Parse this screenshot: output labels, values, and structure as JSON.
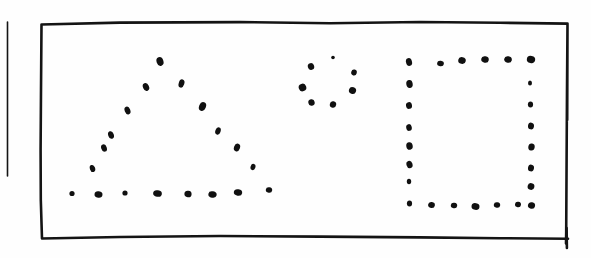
{
  "document": {
    "kind": "hand-drawn-sketch",
    "medium": "ink-on-paper",
    "background_color": "#fefefe",
    "ink_color": "#141414",
    "dot_color": "#101010",
    "width": 591,
    "height": 258,
    "caption": ""
  },
  "frame": {
    "name": "hand-drawn rectangle border",
    "stroke_width": 2.6,
    "path": "M 41.5 24.5 L 120 22.6 L 240 22.1 L 330 23.2 L 420 22.0 L 500 22.8 L 567.5 23.6 L 567.0 90 L 566.6 160 L 566.2 232 L 566.0 243.5 M 567.5 23.6 L 567.2 120 M 41.5 24.5 L 41.0 90 L 40.6 150 L 40.8 200 L 42.0 238.5 L 120 237.0 L 220 236.0 L 320 236.6 L 420 237.4 L 500 238.2 L 568.0 238.8",
    "corner_tick": "M 566.6 228 L 566.9 248"
  },
  "margin_rule": {
    "name": "vertical margin line",
    "x": 7.5,
    "y_top": 22,
    "y_bottom": 176,
    "stroke_width": 1.6
  },
  "shapes": [
    {
      "id": "triangle",
      "label": "dotted triangle",
      "dot_count": 21,
      "dots": [
        {
          "cx": 160.0,
          "cy": 61.5,
          "rx": 3.4,
          "ry": 4.4,
          "rot": -20
        },
        {
          "cx": 146.0,
          "cy": 87.0,
          "rx": 3.0,
          "ry": 4.0,
          "rot": -25
        },
        {
          "cx": 181.5,
          "cy": 83.5,
          "rx": 2.8,
          "ry": 4.2,
          "rot": 18
        },
        {
          "cx": 127.5,
          "cy": 110.5,
          "rx": 2.8,
          "ry": 4.0,
          "rot": -22
        },
        {
          "cx": 202.5,
          "cy": 106.5,
          "rx": 3.4,
          "ry": 4.6,
          "rot": 22
        },
        {
          "cx": 111.0,
          "cy": 135.0,
          "rx": 2.8,
          "ry": 3.9,
          "rot": -20
        },
        {
          "cx": 218.0,
          "cy": 131.0,
          "rx": 2.6,
          "ry": 3.8,
          "rot": 20
        },
        {
          "cx": 104.0,
          "cy": 148.0,
          "rx": 2.8,
          "ry": 3.8,
          "rot": -18
        },
        {
          "cx": 237.0,
          "cy": 147.5,
          "rx": 3.0,
          "ry": 4.0,
          "rot": 20
        },
        {
          "cx": 92.5,
          "cy": 168.5,
          "rx": 2.6,
          "ry": 3.6,
          "rot": -20
        },
        {
          "cx": 253.0,
          "cy": 167.0,
          "rx": 2.4,
          "ry": 3.2,
          "rot": 18
        },
        {
          "cx": 72.0,
          "cy": 193.5,
          "rx": 2.6,
          "ry": 2.6,
          "rot": 0
        },
        {
          "cx": 98.5,
          "cy": 194.5,
          "rx": 4.0,
          "ry": 3.2,
          "rot": 8
        },
        {
          "cx": 125.0,
          "cy": 193.0,
          "rx": 2.6,
          "ry": 2.6,
          "rot": 0
        },
        {
          "cx": 157.5,
          "cy": 193.5,
          "rx": 4.4,
          "ry": 3.2,
          "rot": 10
        },
        {
          "cx": 188.0,
          "cy": 194.0,
          "rx": 3.6,
          "ry": 3.2,
          "rot": 6
        },
        {
          "cx": 212.5,
          "cy": 194.5,
          "rx": 4.2,
          "ry": 3.2,
          "rot": 12
        },
        {
          "cx": 238.0,
          "cy": 192.5,
          "rx": 4.2,
          "ry": 3.2,
          "rot": 10
        },
        {
          "cx": 269.0,
          "cy": 190.0,
          "rx": 3.2,
          "ry": 2.8,
          "rot": 8
        }
      ]
    },
    {
      "id": "circle",
      "label": "dotted circle",
      "dot_count": 8,
      "dots": [
        {
          "cx": 333.0,
          "cy": 57.5,
          "rx": 1.8,
          "ry": 1.8,
          "rot": 0
        },
        {
          "cx": 311.0,
          "cy": 66.5,
          "rx": 3.2,
          "ry": 3.4,
          "rot": -15
        },
        {
          "cx": 354.0,
          "cy": 72.5,
          "rx": 2.8,
          "ry": 3.0,
          "rot": 15
        },
        {
          "cx": 302.5,
          "cy": 87.5,
          "rx": 3.8,
          "ry": 3.8,
          "rot": -20
        },
        {
          "cx": 352.5,
          "cy": 90.5,
          "rx": 3.6,
          "ry": 3.4,
          "rot": 20
        },
        {
          "cx": 311.5,
          "cy": 102.5,
          "rx": 3.2,
          "ry": 3.2,
          "rot": -10
        },
        {
          "cx": 333.0,
          "cy": 104.5,
          "rx": 3.2,
          "ry": 3.2,
          "rot": 10
        }
      ]
    },
    {
      "id": "square",
      "label": "dotted square",
      "dot_count": 22,
      "dots": [
        {
          "cx": 409.0,
          "cy": 62.0,
          "rx": 3.0,
          "ry": 4.0,
          "rot": -15
        },
        {
          "cx": 440.5,
          "cy": 63.5,
          "rx": 3.4,
          "ry": 2.8,
          "rot": 8
        },
        {
          "cx": 462.0,
          "cy": 60.5,
          "rx": 3.8,
          "ry": 3.4,
          "rot": 12
        },
        {
          "cx": 485.0,
          "cy": 59.5,
          "rx": 3.8,
          "ry": 3.2,
          "rot": 10
        },
        {
          "cx": 508.0,
          "cy": 59.5,
          "rx": 3.8,
          "ry": 3.2,
          "rot": 10
        },
        {
          "cx": 531.0,
          "cy": 59.5,
          "rx": 4.2,
          "ry": 3.6,
          "rot": 12
        },
        {
          "cx": 409.5,
          "cy": 84.0,
          "rx": 3.2,
          "ry": 4.0,
          "rot": -10
        },
        {
          "cx": 530.0,
          "cy": 83.0,
          "rx": 2.0,
          "ry": 2.6,
          "rot": 0
        },
        {
          "cx": 409.0,
          "cy": 105.5,
          "rx": 3.0,
          "ry": 3.4,
          "rot": -10
        },
        {
          "cx": 530.5,
          "cy": 104.5,
          "rx": 2.6,
          "ry": 3.0,
          "rot": 0
        },
        {
          "cx": 409.0,
          "cy": 127.5,
          "rx": 2.8,
          "ry": 3.4,
          "rot": -10
        },
        {
          "cx": 531.0,
          "cy": 126.0,
          "rx": 3.0,
          "ry": 3.4,
          "rot": 8
        },
        {
          "cx": 409.5,
          "cy": 146.0,
          "rx": 3.2,
          "ry": 3.8,
          "rot": -12
        },
        {
          "cx": 531.5,
          "cy": 147.0,
          "rx": 3.2,
          "ry": 3.6,
          "rot": 10
        },
        {
          "cx": 409.5,
          "cy": 164.5,
          "rx": 3.0,
          "ry": 3.8,
          "rot": -18
        },
        {
          "cx": 531.0,
          "cy": 168.0,
          "rx": 3.0,
          "ry": 3.4,
          "rot": 10
        },
        {
          "cx": 409.0,
          "cy": 181.5,
          "rx": 2.2,
          "ry": 2.8,
          "rot": 0
        },
        {
          "cx": 531.0,
          "cy": 186.5,
          "rx": 3.4,
          "ry": 3.4,
          "rot": 12
        },
        {
          "cx": 409.5,
          "cy": 203.5,
          "rx": 2.6,
          "ry": 3.0,
          "rot": 0
        },
        {
          "cx": 431.5,
          "cy": 205.0,
          "rx": 3.4,
          "ry": 3.0,
          "rot": 8
        },
        {
          "cx": 454.0,
          "cy": 205.5,
          "rx": 3.2,
          "ry": 2.8,
          "rot": 8
        },
        {
          "cx": 475.5,
          "cy": 206.5,
          "rx": 4.0,
          "ry": 3.4,
          "rot": 10
        },
        {
          "cx": 497.0,
          "cy": 205.0,
          "rx": 3.2,
          "ry": 2.8,
          "rot": 8
        },
        {
          "cx": 518.0,
          "cy": 204.5,
          "rx": 3.0,
          "ry": 2.8,
          "rot": 8
        },
        {
          "cx": 531.5,
          "cy": 205.5,
          "rx": 3.6,
          "ry": 3.2,
          "rot": 12
        }
      ]
    }
  ]
}
